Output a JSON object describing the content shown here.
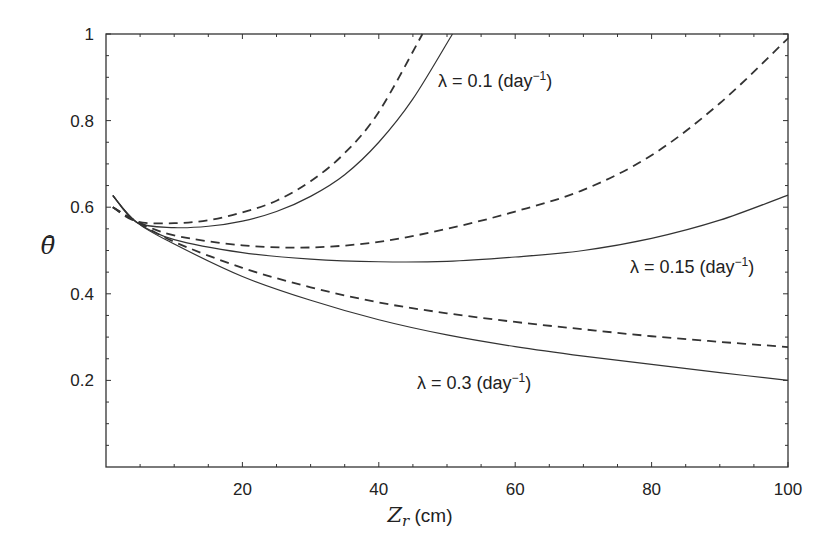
{
  "chart_data": {
    "type": "line",
    "title": "",
    "xlabel": "Z_r (cm)",
    "xlabel_symbol": "Z",
    "xlabel_subscript": "r",
    "xlabel_unit": " (cm)",
    "ylabel": "θ̄",
    "xlim": [
      0,
      100
    ],
    "ylim": [
      0,
      1
    ],
    "xticks": [
      20,
      40,
      60,
      80,
      100
    ],
    "yticks": [
      0.2,
      0.4,
      0.6,
      0.8,
      1
    ],
    "ytick_labels": [
      "0.2",
      "0.4",
      "0.6",
      "0.8",
      "1"
    ],
    "xtick_labels": [
      "20",
      "40",
      "60",
      "80",
      "100"
    ],
    "grid": false,
    "legend": "none (inline annotations)",
    "annotations": [
      {
        "text": "λ = 0.1 (day⁻¹)",
        "lambda": "λ = 0.1 (day",
        "sup": "−1",
        "close": ")",
        "x": 49,
        "y": 0.88
      },
      {
        "text": "λ = 0.15 (day⁻¹)",
        "lambda": "λ = 0.15 (day",
        "sup": "−1",
        "close": ")",
        "x": 75,
        "y": 0.46
      },
      {
        "text": "λ = 0.3 (day⁻¹)",
        "lambda": "λ = 0.3 (day",
        "sup": "−1",
        "close": ")",
        "x": 44,
        "y": 0.22
      }
    ],
    "series": [
      {
        "name": "λ=0.1 solid",
        "style": "solid",
        "x": [
          1,
          4.5,
          10,
          15,
          20,
          25,
          30,
          35,
          40,
          45,
          50.8
        ],
        "y": [
          0.627,
          0.565,
          0.553,
          0.556,
          0.568,
          0.59,
          0.625,
          0.675,
          0.75,
          0.85,
          1.0
        ]
      },
      {
        "name": "λ=0.1 dashed",
        "style": "dashed",
        "x": [
          1,
          4.5,
          10,
          15,
          20,
          25,
          30,
          35,
          40,
          46.4
        ],
        "y": [
          0.6,
          0.567,
          0.563,
          0.57,
          0.588,
          0.615,
          0.66,
          0.725,
          0.82,
          1.0
        ]
      },
      {
        "name": "λ=0.15 solid",
        "style": "solid",
        "x": [
          1,
          4.5,
          10,
          20,
          30,
          40,
          50,
          60,
          70,
          80,
          90,
          100
        ],
        "y": [
          0.627,
          0.565,
          0.525,
          0.495,
          0.48,
          0.474,
          0.475,
          0.485,
          0.5,
          0.528,
          0.57,
          0.628
        ]
      },
      {
        "name": "λ=0.15 dashed",
        "style": "dashed",
        "x": [
          1,
          4.5,
          10,
          20,
          30,
          40,
          50,
          60,
          70,
          80,
          90,
          100
        ],
        "y": [
          0.6,
          0.567,
          0.535,
          0.512,
          0.507,
          0.52,
          0.55,
          0.59,
          0.64,
          0.72,
          0.84,
          0.99
        ]
      },
      {
        "name": "λ=0.3 solid",
        "style": "solid",
        "x": [
          1,
          4.5,
          10,
          20,
          30,
          40,
          50,
          60,
          70,
          80,
          90,
          100
        ],
        "y": [
          0.627,
          0.565,
          0.515,
          0.44,
          0.385,
          0.34,
          0.305,
          0.278,
          0.256,
          0.237,
          0.218,
          0.2
        ]
      },
      {
        "name": "λ=0.3 dashed",
        "style": "dashed",
        "x": [
          1,
          4.5,
          10,
          20,
          30,
          40,
          50,
          60,
          70,
          80,
          90,
          100
        ],
        "y": [
          0.6,
          0.567,
          0.52,
          0.46,
          0.415,
          0.38,
          0.355,
          0.335,
          0.318,
          0.302,
          0.289,
          0.277
        ]
      }
    ]
  }
}
